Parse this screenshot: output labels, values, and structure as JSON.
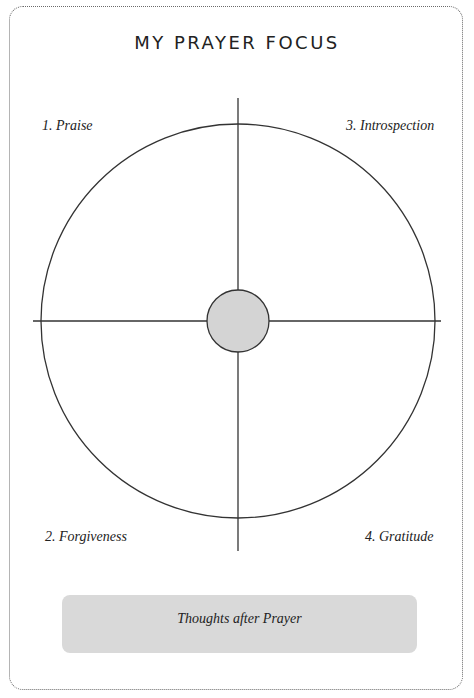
{
  "page": {
    "title": "MY PRAYER FOCUS"
  },
  "quadrants": [
    {
      "label": "1. Praise",
      "position": "top-left"
    },
    {
      "label": "2. Forgiveness",
      "position": "bottom-left"
    },
    {
      "label": "3. Introspection",
      "position": "top-right"
    },
    {
      "label": "4. Gratitude",
      "position": "bottom-right"
    }
  ],
  "thoughts_box": {
    "label": "Thoughts after Prayer"
  },
  "colors": {
    "line": "#333333",
    "center_fill": "#d4d4d4",
    "box_fill": "#d9d9d9",
    "border": "#6a6a6a"
  }
}
